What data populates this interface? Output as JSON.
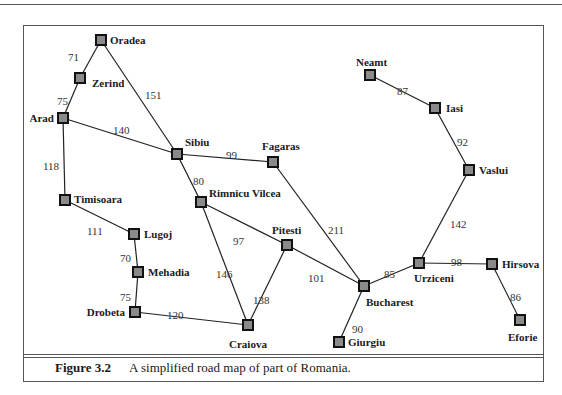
{
  "figure": {
    "number": "Figure 3.2",
    "caption": "A simplified road map of part of Romania."
  },
  "colors": {
    "node_fill": "#8a8a8a",
    "node_stroke": "#111111",
    "edge": "#222222",
    "frame": "#555555"
  },
  "graph": {
    "nodes": [
      {
        "id": "Oradea",
        "x": 101,
        "y": 40,
        "lx": 110,
        "ly": 44,
        "anchor": "start"
      },
      {
        "id": "Zerind",
        "x": 80,
        "y": 78,
        "lx": 92,
        "ly": 87,
        "anchor": "start"
      },
      {
        "id": "Arad",
        "x": 63,
        "y": 118,
        "lx": 54,
        "ly": 122,
        "anchor": "end"
      },
      {
        "id": "Timisoara",
        "x": 65,
        "y": 200,
        "lx": 74,
        "ly": 203,
        "anchor": "start"
      },
      {
        "id": "Lugoj",
        "x": 134,
        "y": 234,
        "lx": 144,
        "ly": 238,
        "anchor": "start"
      },
      {
        "id": "Mehadia",
        "x": 138,
        "y": 272,
        "lx": 148,
        "ly": 276,
        "anchor": "start"
      },
      {
        "id": "Drobeta",
        "x": 135,
        "y": 312,
        "lx": 125,
        "ly": 316,
        "anchor": "end"
      },
      {
        "id": "Craiova",
        "x": 248,
        "y": 325,
        "lx": 248,
        "ly": 348,
        "anchor": "middle"
      },
      {
        "id": "Sibiu",
        "x": 177,
        "y": 154,
        "lx": 185,
        "ly": 146,
        "anchor": "start"
      },
      {
        "id": "Rimnicu Vilcea",
        "x": 201,
        "y": 202,
        "lx": 209,
        "ly": 197,
        "anchor": "start"
      },
      {
        "id": "Fagaras",
        "x": 273,
        "y": 162,
        "lx": 262,
        "ly": 150,
        "anchor": "start"
      },
      {
        "id": "Pitesti",
        "x": 287,
        "y": 245,
        "lx": 272,
        "ly": 234,
        "anchor": "start"
      },
      {
        "id": "Bucharest",
        "x": 364,
        "y": 286,
        "lx": 366,
        "ly": 306,
        "anchor": "start"
      },
      {
        "id": "Giurgiu",
        "x": 339,
        "y": 342,
        "lx": 348,
        "ly": 346,
        "anchor": "start"
      },
      {
        "id": "Urziceni",
        "x": 419,
        "y": 263,
        "lx": 414,
        "ly": 282,
        "anchor": "start"
      },
      {
        "id": "Hirsova",
        "x": 492,
        "y": 264,
        "lx": 502,
        "ly": 268,
        "anchor": "start"
      },
      {
        "id": "Eforie",
        "x": 520,
        "y": 320,
        "lx": 508,
        "ly": 341,
        "anchor": "start"
      },
      {
        "id": "Vaslui",
        "x": 469,
        "y": 170,
        "lx": 479,
        "ly": 174,
        "anchor": "start"
      },
      {
        "id": "Iasi",
        "x": 435,
        "y": 108,
        "lx": 446,
        "ly": 112,
        "anchor": "start"
      },
      {
        "id": "Neamt",
        "x": 370,
        "y": 75,
        "lx": 356,
        "ly": 66,
        "anchor": "start"
      }
    ],
    "edges": [
      {
        "from": "Oradea",
        "to": "Zerind",
        "cost": "71",
        "lx": 68,
        "ly": 57
      },
      {
        "from": "Zerind",
        "to": "Arad",
        "cost": "75",
        "lx": 57,
        "ly": 101
      },
      {
        "from": "Oradea",
        "to": "Sibiu",
        "cost": "151",
        "lx": 145,
        "ly": 95
      },
      {
        "from": "Arad",
        "to": "Sibiu",
        "cost": "140",
        "lx": 113,
        "ly": 130
      },
      {
        "from": "Arad",
        "to": "Timisoara",
        "cost": "118",
        "lx": 43,
        "ly": 166
      },
      {
        "from": "Timisoara",
        "to": "Lugoj",
        "cost": "111",
        "lx": 87,
        "ly": 231
      },
      {
        "from": "Lugoj",
        "to": "Mehadia",
        "cost": "70",
        "lx": 120,
        "ly": 258
      },
      {
        "from": "Mehadia",
        "to": "Drobeta",
        "cost": "75",
        "lx": 120,
        "ly": 297
      },
      {
        "from": "Drobeta",
        "to": "Craiova",
        "cost": "120",
        "lx": 167,
        "ly": 315
      },
      {
        "from": "Sibiu",
        "to": "Fagaras",
        "cost": "99",
        "lx": 226,
        "ly": 155
      },
      {
        "from": "Sibiu",
        "to": "Rimnicu Vilcea",
        "cost": "80",
        "lx": 193,
        "ly": 181
      },
      {
        "from": "Rimnicu Vilcea",
        "to": "Pitesti",
        "cost": "97",
        "lx": 233,
        "ly": 241
      },
      {
        "from": "Rimnicu Vilcea",
        "to": "Craiova",
        "cost": "146",
        "lx": 216,
        "ly": 274
      },
      {
        "from": "Pitesti",
        "to": "Craiova",
        "cost": "138",
        "lx": 253,
        "ly": 300
      },
      {
        "from": "Pitesti",
        "to": "Bucharest",
        "cost": "101",
        "lx": 308,
        "ly": 278
      },
      {
        "from": "Fagaras",
        "to": "Bucharest",
        "cost": "211",
        "lx": 328,
        "ly": 230
      },
      {
        "from": "Bucharest",
        "to": "Giurgiu",
        "cost": "90",
        "lx": 352,
        "ly": 329
      },
      {
        "from": "Bucharest",
        "to": "Urziceni",
        "cost": "85",
        "lx": 384,
        "ly": 274
      },
      {
        "from": "Urziceni",
        "to": "Hirsova",
        "cost": "98",
        "lx": 451,
        "ly": 262
      },
      {
        "from": "Hirsova",
        "to": "Eforie",
        "cost": "86",
        "lx": 510,
        "ly": 297
      },
      {
        "from": "Urziceni",
        "to": "Vaslui",
        "cost": "142",
        "lx": 450,
        "ly": 224
      },
      {
        "from": "Vaslui",
        "to": "Iasi",
        "cost": "92",
        "lx": 457,
        "ly": 142
      },
      {
        "from": "Iasi",
        "to": "Neamt",
        "cost": "87",
        "lx": 397,
        "ly": 91
      }
    ]
  }
}
